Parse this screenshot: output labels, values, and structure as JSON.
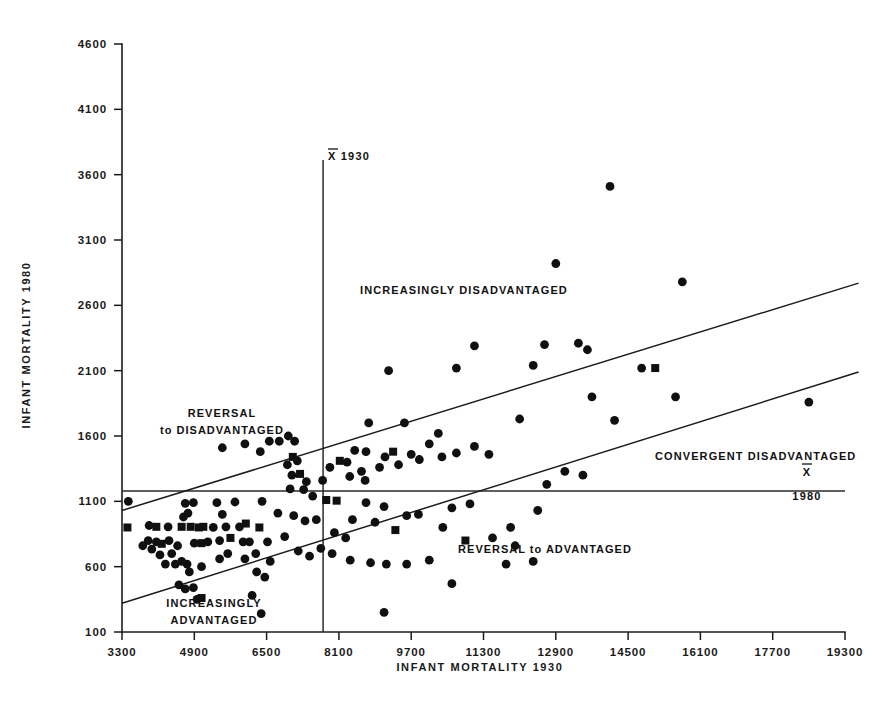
{
  "figure": {
    "background": "#ffffff",
    "ink": "#111111"
  },
  "axes": {
    "x": {
      "title": "INFANT  MORTALITY  1930",
      "ticks": [
        "3300",
        "4900",
        "6500",
        "8100",
        "9700",
        "11300",
        "12900",
        "14500",
        "16100",
        "17700",
        "19300"
      ],
      "tick_values": [
        3300,
        4900,
        6500,
        8100,
        9700,
        11300,
        12900,
        14500,
        16100,
        17700,
        19300
      ],
      "range": [
        3300,
        19300
      ]
    },
    "y": {
      "title": "INFANT  MORTALITY  1980",
      "ticks": [
        "4600",
        "4100",
        "3600",
        "3100",
        "2600",
        "2100",
        "1600",
        "1100",
        "600",
        "100"
      ],
      "tick_values": [
        4600,
        4100,
        3600,
        3100,
        2600,
        2100,
        1600,
        1100,
        600,
        100
      ],
      "range": [
        100,
        4600
      ]
    }
  },
  "annotations": {
    "mean_x_label": "X 1930",
    "mean_x_symbol": "X",
    "mean_x_year": "1930",
    "mean_y_symbol": "X",
    "mean_y_year": "1980",
    "region_increasingly_disadvantaged": "INCREASINGLY  DISADVANTAGED",
    "region_reversal_line1": "REVERSAL",
    "region_reversal_line2": "to  DISADVANTAGED",
    "region_convergent_disadvantaged": "CONVERGENT  DISADVANTAGED",
    "region_reversal_to_advantaged": "REVERSAL  to  ADVANTAGED",
    "region_increasingly_advantaged_line1": "INCREASINGLY",
    "region_increasingly_advantaged_line2": "ADVANTAGED"
  },
  "chart_data": {
    "type": "scatter",
    "title": "",
    "xlabel": "INFANT MORTALITY 1930",
    "ylabel": "INFANT MORTALITY 1980",
    "xlim": [
      3300,
      19300
    ],
    "ylim": [
      100,
      4600
    ],
    "grid": false,
    "legend": null,
    "reference_lines": [
      {
        "name": "mean-1930-vertical",
        "orientation": "vertical",
        "x": 7750,
        "label": "X 1930"
      },
      {
        "name": "mean-1980-horizontal",
        "orientation": "horizontal",
        "y": 1180,
        "label": "X 1980"
      },
      {
        "name": "upper-band",
        "orientation": "sloped",
        "x1": 3300,
        "y1": 1030,
        "x2": 19600,
        "y2": 2770
      },
      {
        "name": "lower-band",
        "orientation": "sloped",
        "x1": 3300,
        "y1": 320,
        "x2": 19600,
        "y2": 2090
      }
    ],
    "markers": {
      "circle": "filled-circle",
      "square": "filled-square"
    },
    "points": [
      {
        "x": 3440,
        "y": 1100,
        "m": "c"
      },
      {
        "x": 3420,
        "y": 900,
        "m": "s"
      },
      {
        "x": 3900,
        "y": 915,
        "m": "c"
      },
      {
        "x": 4060,
        "y": 905,
        "m": "s"
      },
      {
        "x": 3880,
        "y": 800,
        "m": "c"
      },
      {
        "x": 4060,
        "y": 790,
        "m": "c"
      },
      {
        "x": 3760,
        "y": 760,
        "m": "c"
      },
      {
        "x": 3960,
        "y": 735,
        "m": "c"
      },
      {
        "x": 4180,
        "y": 775,
        "m": "s"
      },
      {
        "x": 4320,
        "y": 905,
        "m": "c"
      },
      {
        "x": 4340,
        "y": 800,
        "m": "c"
      },
      {
        "x": 4140,
        "y": 690,
        "m": "c"
      },
      {
        "x": 4400,
        "y": 700,
        "m": "c"
      },
      {
        "x": 4530,
        "y": 760,
        "m": "c"
      },
      {
        "x": 4620,
        "y": 905,
        "m": "s"
      },
      {
        "x": 4700,
        "y": 1085,
        "m": "c"
      },
      {
        "x": 4760,
        "y": 1010,
        "m": "c"
      },
      {
        "x": 4660,
        "y": 980,
        "m": "c"
      },
      {
        "x": 4880,
        "y": 1090,
        "m": "c"
      },
      {
        "x": 4820,
        "y": 905,
        "m": "s"
      },
      {
        "x": 5000,
        "y": 900,
        "m": "s"
      },
      {
        "x": 5100,
        "y": 905,
        "m": "s"
      },
      {
        "x": 4900,
        "y": 780,
        "m": "c"
      },
      {
        "x": 5060,
        "y": 780,
        "m": "s"
      },
      {
        "x": 5200,
        "y": 790,
        "m": "c"
      },
      {
        "x": 4740,
        "y": 620,
        "m": "c"
      },
      {
        "x": 4790,
        "y": 560,
        "m": "c"
      },
      {
        "x": 5060,
        "y": 600,
        "m": "c"
      },
      {
        "x": 4620,
        "y": 640,
        "m": "c"
      },
      {
        "x": 4480,
        "y": 620,
        "m": "c"
      },
      {
        "x": 4260,
        "y": 620,
        "m": "c"
      },
      {
        "x": 4560,
        "y": 460,
        "m": "c"
      },
      {
        "x": 4880,
        "y": 440,
        "m": "c"
      },
      {
        "x": 4700,
        "y": 430,
        "m": "c"
      },
      {
        "x": 5060,
        "y": 360,
        "m": "s"
      },
      {
        "x": 4960,
        "y": 350,
        "m": "c"
      },
      {
        "x": 5320,
        "y": 900,
        "m": "c"
      },
      {
        "x": 5400,
        "y": 1090,
        "m": "c"
      },
      {
        "x": 5520,
        "y": 1000,
        "m": "c"
      },
      {
        "x": 5600,
        "y": 905,
        "m": "c"
      },
      {
        "x": 5460,
        "y": 800,
        "m": "c"
      },
      {
        "x": 5700,
        "y": 820,
        "m": "s"
      },
      {
        "x": 5640,
        "y": 700,
        "m": "c"
      },
      {
        "x": 5460,
        "y": 660,
        "m": "c"
      },
      {
        "x": 5800,
        "y": 1095,
        "m": "c"
      },
      {
        "x": 5900,
        "y": 905,
        "m": "c"
      },
      {
        "x": 6040,
        "y": 930,
        "m": "s"
      },
      {
        "x": 5980,
        "y": 790,
        "m": "c"
      },
      {
        "x": 6120,
        "y": 790,
        "m": "c"
      },
      {
        "x": 6020,
        "y": 660,
        "m": "c"
      },
      {
        "x": 6260,
        "y": 700,
        "m": "c"
      },
      {
        "x": 6400,
        "y": 1100,
        "m": "c"
      },
      {
        "x": 6340,
        "y": 900,
        "m": "s"
      },
      {
        "x": 6520,
        "y": 790,
        "m": "c"
      },
      {
        "x": 6580,
        "y": 640,
        "m": "c"
      },
      {
        "x": 6280,
        "y": 560,
        "m": "c"
      },
      {
        "x": 6460,
        "y": 520,
        "m": "c"
      },
      {
        "x": 6180,
        "y": 380,
        "m": "c"
      },
      {
        "x": 6380,
        "y": 240,
        "m": "c"
      },
      {
        "x": 5520,
        "y": 1510,
        "m": "c"
      },
      {
        "x": 6020,
        "y": 1540,
        "m": "c"
      },
      {
        "x": 6360,
        "y": 1480,
        "m": "c"
      },
      {
        "x": 6560,
        "y": 1560,
        "m": "c"
      },
      {
        "x": 6780,
        "y": 1560,
        "m": "c"
      },
      {
        "x": 6980,
        "y": 1600,
        "m": "c"
      },
      {
        "x": 7120,
        "y": 1560,
        "m": "c"
      },
      {
        "x": 7080,
        "y": 1440,
        "m": "s"
      },
      {
        "x": 7180,
        "y": 1410,
        "m": "c"
      },
      {
        "x": 6960,
        "y": 1380,
        "m": "c"
      },
      {
        "x": 7060,
        "y": 1300,
        "m": "c"
      },
      {
        "x": 7240,
        "y": 1310,
        "m": "s"
      },
      {
        "x": 7380,
        "y": 1250,
        "m": "c"
      },
      {
        "x": 7020,
        "y": 1195,
        "m": "c"
      },
      {
        "x": 7320,
        "y": 1190,
        "m": "c"
      },
      {
        "x": 7520,
        "y": 1140,
        "m": "c"
      },
      {
        "x": 7820,
        "y": 1110,
        "m": "s"
      },
      {
        "x": 8050,
        "y": 1105,
        "m": "s"
      },
      {
        "x": 7740,
        "y": 1260,
        "m": "c"
      },
      {
        "x": 7900,
        "y": 1360,
        "m": "c"
      },
      {
        "x": 8120,
        "y": 1410,
        "m": "s"
      },
      {
        "x": 8280,
        "y": 1400,
        "m": "c"
      },
      {
        "x": 8450,
        "y": 1490,
        "m": "c"
      },
      {
        "x": 8700,
        "y": 1480,
        "m": "c"
      },
      {
        "x": 8340,
        "y": 1290,
        "m": "c"
      },
      {
        "x": 8600,
        "y": 1330,
        "m": "c"
      },
      {
        "x": 8680,
        "y": 1260,
        "m": "c"
      },
      {
        "x": 9000,
        "y": 1360,
        "m": "c"
      },
      {
        "x": 9120,
        "y": 1440,
        "m": "c"
      },
      {
        "x": 9300,
        "y": 1480,
        "m": "s"
      },
      {
        "x": 9420,
        "y": 1380,
        "m": "c"
      },
      {
        "x": 9700,
        "y": 1460,
        "m": "c"
      },
      {
        "x": 9880,
        "y": 1420,
        "m": "c"
      },
      {
        "x": 10100,
        "y": 1540,
        "m": "c"
      },
      {
        "x": 10380,
        "y": 1440,
        "m": "c"
      },
      {
        "x": 10700,
        "y": 1470,
        "m": "c"
      },
      {
        "x": 11100,
        "y": 1520,
        "m": "c"
      },
      {
        "x": 11420,
        "y": 1460,
        "m": "c"
      },
      {
        "x": 9550,
        "y": 1700,
        "m": "c"
      },
      {
        "x": 10300,
        "y": 1620,
        "m": "c"
      },
      {
        "x": 8760,
        "y": 1700,
        "m": "c"
      },
      {
        "x": 9200,
        "y": 2100,
        "m": "c"
      },
      {
        "x": 10700,
        "y": 2120,
        "m": "c"
      },
      {
        "x": 11100,
        "y": 2290,
        "m": "c"
      },
      {
        "x": 12400,
        "y": 2140,
        "m": "c"
      },
      {
        "x": 12100,
        "y": 1730,
        "m": "c"
      },
      {
        "x": 12650,
        "y": 2300,
        "m": "c"
      },
      {
        "x": 13400,
        "y": 2310,
        "m": "c"
      },
      {
        "x": 13600,
        "y": 2260,
        "m": "c"
      },
      {
        "x": 12900,
        "y": 2920,
        "m": "c"
      },
      {
        "x": 14100,
        "y": 3510,
        "m": "c"
      },
      {
        "x": 13700,
        "y": 1900,
        "m": "c"
      },
      {
        "x": 15700,
        "y": 2780,
        "m": "c"
      },
      {
        "x": 15550,
        "y": 1900,
        "m": "c"
      },
      {
        "x": 14800,
        "y": 2120,
        "m": "c"
      },
      {
        "x": 15100,
        "y": 2120,
        "m": "s"
      },
      {
        "x": 14200,
        "y": 1720,
        "m": "c"
      },
      {
        "x": 18500,
        "y": 1860,
        "m": "c"
      },
      {
        "x": 13100,
        "y": 1330,
        "m": "c"
      },
      {
        "x": 13500,
        "y": 1300,
        "m": "c"
      },
      {
        "x": 12700,
        "y": 1230,
        "m": "c"
      },
      {
        "x": 12500,
        "y": 1030,
        "m": "c"
      },
      {
        "x": 11900,
        "y": 900,
        "m": "c"
      },
      {
        "x": 11500,
        "y": 820,
        "m": "c"
      },
      {
        "x": 10900,
        "y": 800,
        "m": "s"
      },
      {
        "x": 10400,
        "y": 900,
        "m": "c"
      },
      {
        "x": 10600,
        "y": 1050,
        "m": "c"
      },
      {
        "x": 11000,
        "y": 1080,
        "m": "c"
      },
      {
        "x": 9600,
        "y": 990,
        "m": "c"
      },
      {
        "x": 9860,
        "y": 1000,
        "m": "c"
      },
      {
        "x": 9350,
        "y": 880,
        "m": "s"
      },
      {
        "x": 9100,
        "y": 1060,
        "m": "c"
      },
      {
        "x": 8900,
        "y": 940,
        "m": "c"
      },
      {
        "x": 8700,
        "y": 1090,
        "m": "c"
      },
      {
        "x": 8400,
        "y": 960,
        "m": "c"
      },
      {
        "x": 8250,
        "y": 820,
        "m": "c"
      },
      {
        "x": 8000,
        "y": 860,
        "m": "c"
      },
      {
        "x": 8350,
        "y": 650,
        "m": "c"
      },
      {
        "x": 8800,
        "y": 630,
        "m": "c"
      },
      {
        "x": 9150,
        "y": 620,
        "m": "c"
      },
      {
        "x": 9600,
        "y": 620,
        "m": "c"
      },
      {
        "x": 10100,
        "y": 650,
        "m": "c"
      },
      {
        "x": 7950,
        "y": 700,
        "m": "c"
      },
      {
        "x": 7700,
        "y": 740,
        "m": "c"
      },
      {
        "x": 7450,
        "y": 680,
        "m": "c"
      },
      {
        "x": 7200,
        "y": 720,
        "m": "c"
      },
      {
        "x": 6900,
        "y": 830,
        "m": "c"
      },
      {
        "x": 7100,
        "y": 990,
        "m": "c"
      },
      {
        "x": 6750,
        "y": 1010,
        "m": "c"
      },
      {
        "x": 7600,
        "y": 960,
        "m": "c"
      },
      {
        "x": 7350,
        "y": 950,
        "m": "c"
      },
      {
        "x": 10600,
        "y": 470,
        "m": "c"
      },
      {
        "x": 9100,
        "y": 250,
        "m": "c"
      },
      {
        "x": 12000,
        "y": 760,
        "m": "c"
      },
      {
        "x": 12400,
        "y": 640,
        "m": "c"
      },
      {
        "x": 11800,
        "y": 620,
        "m": "c"
      }
    ]
  }
}
